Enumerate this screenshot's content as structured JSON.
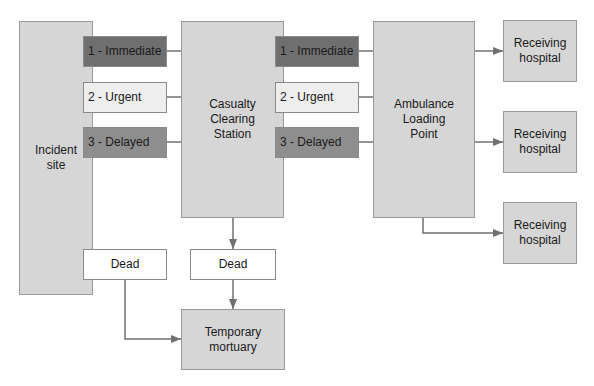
{
  "diagram": {
    "nodes": {
      "incident_site": "Incident\nsite",
      "casualty_clearing_station": "Casualty\nClearing\nStation",
      "ambulance_loading_point": "Ambulance\nLoading\nPoint",
      "receiving_hospital_1": "Receiving\nhospital",
      "receiving_hospital_2": "Receiving\nhospital",
      "receiving_hospital_3": "Receiving\nhospital",
      "temporary_mortuary": "Temporary\nmortuary"
    },
    "triage_incident": {
      "immediate": "1 - Immediate",
      "urgent": "2 - Urgent",
      "delayed": "3 - Delayed",
      "dead": "Dead"
    },
    "triage_ccs": {
      "immediate": "1 - Immediate",
      "urgent": "2 - Urgent",
      "delayed": "3 - Delayed",
      "dead": "Dead"
    },
    "colors": {
      "box_fill": "#d6d6d6",
      "immediate": "#6f6f6f",
      "urgent": "#eeeeee",
      "delayed": "#8e8e8e",
      "dead": "#ffffff",
      "arrow": "#707070"
    }
  }
}
